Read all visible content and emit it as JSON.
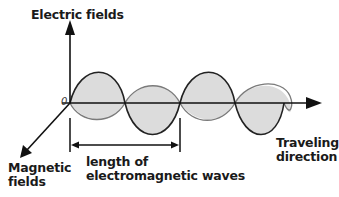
{
  "diagram": {
    "labels": {
      "electric_axis": "Electric fields",
      "magnetic_axis_line1": "Magnetic",
      "magnetic_axis_line2": "fields",
      "traveling_line1": "Traveling",
      "traveling_line2": "direction",
      "wavelength_line1": "length of",
      "wavelength_line2": "electromagnetic waves",
      "origin": "0"
    },
    "colors": {
      "background": "#ffffff",
      "axis": "#111111",
      "electric_wave_stroke": "#222222",
      "magnetic_wave_stroke": "#777777",
      "wave_fill": "#dcdcdc",
      "text": "#1a1a1a"
    }
  }
}
